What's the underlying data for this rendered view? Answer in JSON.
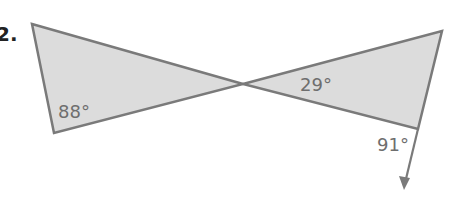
{
  "problem": {
    "number": "2."
  },
  "figure": {
    "fill": "#dcdcdc",
    "stroke": "#7a7a7a",
    "label_color": "#6e6e6e",
    "left_triangle": {
      "vertices": [
        [
          32,
          24
        ],
        [
          243,
          84
        ],
        [
          54,
          133
        ]
      ],
      "angle_label": "88°",
      "label_pos": [
        58,
        118
      ]
    },
    "right_triangle": {
      "vertices": [
        [
          243,
          84
        ],
        [
          442,
          31
        ],
        [
          418,
          129
        ]
      ],
      "angle_label": "29°",
      "label_pos": [
        300,
        91
      ]
    },
    "exterior_ray": {
      "from": [
        418,
        129
      ],
      "to": [
        404,
        188
      ],
      "angle_label": "91°",
      "label_pos": [
        377,
        151
      ]
    }
  }
}
